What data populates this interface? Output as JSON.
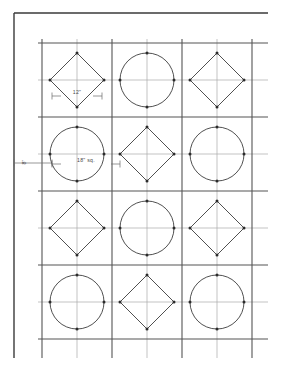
{
  "drawing": {
    "title": "Tile Layout Plan",
    "background_color": "#ffffff",
    "border": {
      "name": "sheet-border",
      "color": "#3a3a3a",
      "width": 1.4,
      "top_line": {
        "x1": 14,
        "y1": 13,
        "x2": 268,
        "y2": 13
      },
      "left_line": {
        "x1": 14,
        "y1": 13,
        "x2": 14,
        "y2": 358
      }
    },
    "grid": {
      "major_color": "#555555",
      "minor_color": "#a9a9a9",
      "major_width": 1.1,
      "minor_width": 0.7,
      "cell_size": 70,
      "columns": 3,
      "rows": 4,
      "x_major": [
        42,
        112,
        182,
        252
      ],
      "x_minor": [
        77,
        147,
        217
      ],
      "y_major": [
        43,
        117,
        191,
        265,
        339
      ],
      "y_minor": [
        80,
        154,
        228,
        302
      ],
      "x_start": 38,
      "x_end": 268,
      "y_start": 39,
      "y_end": 358
    },
    "tiles": {
      "shape_color": "#3c3c3c",
      "shape_width": 0.9,
      "vertex_dot_color": "#2b2b2b",
      "vertex_dot_radius": 1.5,
      "circle_radius": 27,
      "diamond_radius": 27,
      "rows": [
        {
          "row": 1,
          "center_y": 80,
          "cells": [
            {
              "col": 1,
              "center_x": 77,
              "shape": "diamond"
            },
            {
              "col": 2,
              "center_x": 147,
              "shape": "circle"
            },
            {
              "col": 3,
              "center_x": 217,
              "shape": "diamond"
            }
          ]
        },
        {
          "row": 2,
          "center_y": 154,
          "cells": [
            {
              "col": 1,
              "center_x": 77,
              "shape": "circle"
            },
            {
              "col": 2,
              "center_x": 147,
              "shape": "diamond"
            },
            {
              "col": 3,
              "center_x": 217,
              "shape": "circle"
            }
          ]
        },
        {
          "row": 3,
          "center_y": 228,
          "cells": [
            {
              "col": 1,
              "center_x": 77,
              "shape": "diamond"
            },
            {
              "col": 2,
              "center_x": 147,
              "shape": "circle"
            },
            {
              "col": 3,
              "center_x": 217,
              "shape": "diamond"
            }
          ]
        },
        {
          "row": 4,
          "center_y": 302,
          "cells": [
            {
              "col": 1,
              "center_x": 77,
              "shape": "circle"
            },
            {
              "col": 2,
              "center_x": 147,
              "shape": "diamond"
            },
            {
              "col": 3,
              "center_x": 217,
              "shape": "circle"
            }
          ]
        }
      ]
    },
    "dimensions": {
      "color": "#6b6b6b",
      "line_width": 0.7,
      "font_size": 5.2,
      "tile_width": {
        "name": "tile-width-dimension",
        "label": "12\"",
        "orientation": "horizontal",
        "y": 96,
        "x1": 52,
        "x2": 102,
        "label_x": 77,
        "label_y": 94
      },
      "tile_square": {
        "name": "tile-square-dimension",
        "label": "18\" sq.",
        "orientation": "horizontal",
        "y": 164,
        "x1": 52,
        "x2": 120,
        "label_x": 86,
        "label_y": 162
      },
      "border_offset": {
        "name": "border-offset-dimension",
        "label": "8\"",
        "orientation": "vertical-rotated",
        "y": 163,
        "x1": 14,
        "x2": 52,
        "label_x": 26,
        "label_y": 162
      }
    }
  }
}
